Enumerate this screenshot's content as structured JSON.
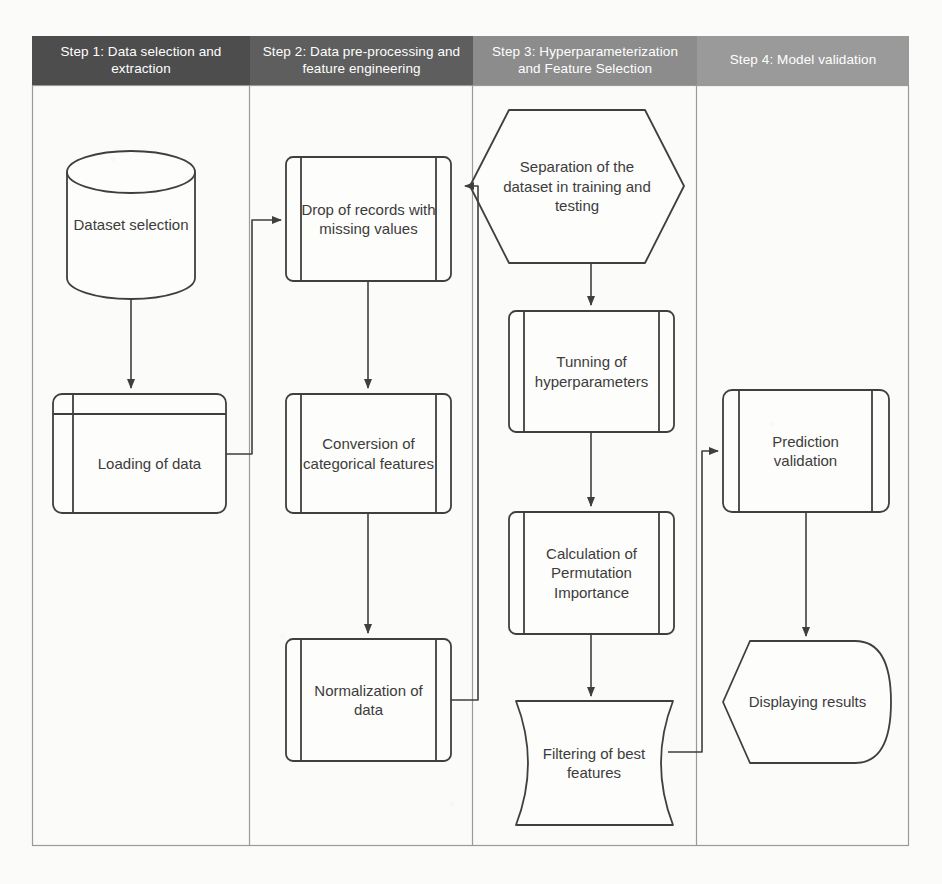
{
  "diagram": {
    "type": "flowchart",
    "orientation": "swimlane-columns",
    "colors": {
      "lane1_header_bg": "#4d4d4d",
      "lane2_header_bg": "#5e5e5e",
      "lane3_header_bg": "#8c8c8c",
      "lane4_header_bg": "#9a9a9a",
      "header_text": "#ffffff",
      "node_stroke": "#3f3f3f",
      "node_fill": "#fdfdfb",
      "node_text": "#3c3c3c",
      "frame_stroke": "#9a9a9a",
      "page_bg": "#fbfbf9"
    }
  },
  "lanes": [
    {
      "id": "lane1",
      "header": "Step 1: Data selection and extraction"
    },
    {
      "id": "lane2",
      "header": "Step 2: Data pre-processing and feature engineering"
    },
    {
      "id": "lane3",
      "header": "Step 3: Hyperparameterization and Feature Selection"
    },
    {
      "id": "lane4",
      "header": "Step 4: Model validation"
    }
  ],
  "nodes": [
    {
      "id": "n1",
      "lane": "lane1",
      "shape": "cylinder",
      "label": "Dataset selection"
    },
    {
      "id": "n2",
      "lane": "lane1",
      "shape": "internal-storage",
      "label": "Loading of data"
    },
    {
      "id": "n3",
      "lane": "lane2",
      "shape": "predefined-process",
      "label": "Drop of records with missing values"
    },
    {
      "id": "n4",
      "lane": "lane2",
      "shape": "predefined-process",
      "label": "Conversion of categorical features"
    },
    {
      "id": "n5",
      "lane": "lane2",
      "shape": "predefined-process",
      "label": "Normalization of data"
    },
    {
      "id": "n6",
      "lane": "lane3",
      "shape": "hexagon",
      "label": "Separation of the dataset in training and testing"
    },
    {
      "id": "n7",
      "lane": "lane3",
      "shape": "predefined-process",
      "label": "Tunning of hyperparameters"
    },
    {
      "id": "n8",
      "lane": "lane3",
      "shape": "predefined-process",
      "label": "Calculation of Permutation Importance"
    },
    {
      "id": "n9",
      "lane": "lane3",
      "shape": "stored-data",
      "label": "Filtering of best features"
    },
    {
      "id": "n10",
      "lane": "lane4",
      "shape": "predefined-process",
      "label": "Prediction validation"
    },
    {
      "id": "n11",
      "lane": "lane4",
      "shape": "display",
      "label": "Displaying results"
    }
  ],
  "edges": [
    {
      "from": "n1",
      "to": "n2",
      "style": "straight-down"
    },
    {
      "from": "n2",
      "to": "n3",
      "style": "right-up-right"
    },
    {
      "from": "n3",
      "to": "n4",
      "style": "straight-down"
    },
    {
      "from": "n4",
      "to": "n5",
      "style": "straight-down"
    },
    {
      "from": "n5",
      "to": "n6",
      "style": "right-up-right"
    },
    {
      "from": "n6",
      "to": "n7",
      "style": "straight-down"
    },
    {
      "from": "n7",
      "to": "n8",
      "style": "straight-down"
    },
    {
      "from": "n8",
      "to": "n9",
      "style": "straight-down"
    },
    {
      "from": "n9",
      "to": "n10",
      "style": "right-up-right"
    },
    {
      "from": "n10",
      "to": "n11",
      "style": "straight-down"
    }
  ]
}
